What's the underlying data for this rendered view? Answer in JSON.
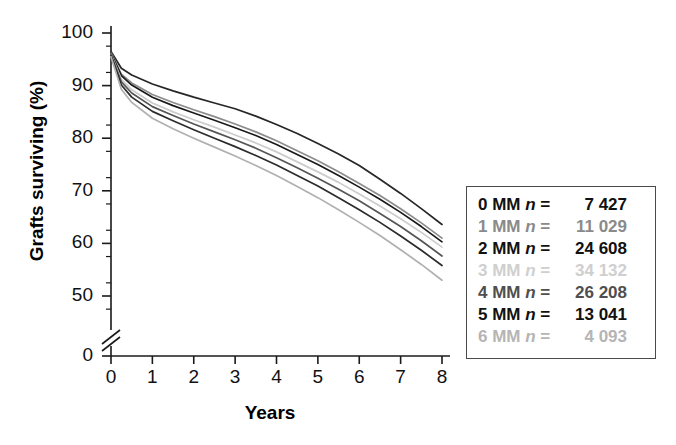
{
  "chart_data": {
    "type": "line",
    "title": "",
    "xlabel": "Years",
    "ylabel": "Grafts surviving (%)",
    "xlim": [
      0,
      8
    ],
    "ylim": [
      45,
      100
    ],
    "y_axis_break": true,
    "y_break_value": 0,
    "grid": false,
    "legend_position": "right-outside",
    "xticks": [
      "0",
      "1",
      "2",
      "3",
      "4",
      "5",
      "6",
      "7",
      "8"
    ],
    "yticks": [
      "0",
      "50",
      "60",
      "70",
      "80",
      "90",
      "100"
    ],
    "y_minor_tick_interval": 5,
    "x": [
      0,
      0.25,
      0.5,
      1,
      1.5,
      2,
      2.5,
      3,
      3.5,
      4,
      4.5,
      5,
      5.5,
      6,
      6.5,
      7,
      7.5,
      8
    ],
    "series": [
      {
        "name": "0 MM",
        "n": "7 427",
        "color": "#262626",
        "values": [
          96.5,
          93.3,
          92.0,
          90.3,
          89.0,
          87.8,
          86.7,
          85.6,
          84.2,
          82.6,
          80.9,
          79.0,
          77.0,
          74.8,
          72.2,
          69.5,
          66.6,
          63.6
        ]
      },
      {
        "name": "1 MM",
        "n": "11 029",
        "color": "#8c8c8c",
        "values": [
          96.3,
          92.2,
          90.5,
          88.3,
          86.8,
          85.4,
          84.1,
          82.7,
          81.2,
          79.5,
          77.6,
          75.7,
          73.6,
          71.4,
          69.1,
          66.6,
          63.9,
          61.0
        ]
      },
      {
        "name": "2 MM",
        "n": "24 608",
        "color": "#1a1a1a",
        "values": [
          96.2,
          91.9,
          90.1,
          87.8,
          86.2,
          84.8,
          83.4,
          82.0,
          80.5,
          78.8,
          76.9,
          75.0,
          72.9,
          70.7,
          68.4,
          65.9,
          63.2,
          60.3
        ]
      },
      {
        "name": "3 MM",
        "n": "34 132",
        "color": "#cccccc",
        "values": [
          96.0,
          91.2,
          89.2,
          86.7,
          85.0,
          83.5,
          82.1,
          80.6,
          79.1,
          77.4,
          75.5,
          73.6,
          71.6,
          69.4,
          67.1,
          64.7,
          62.1,
          59.3
        ]
      },
      {
        "name": "4 MM",
        "n": "26 208",
        "color": "#555555",
        "values": [
          95.9,
          90.7,
          88.6,
          86.0,
          84.3,
          82.7,
          81.2,
          79.7,
          78.1,
          76.3,
          74.4,
          72.4,
          70.3,
          68.1,
          65.7,
          63.2,
          60.5,
          57.6
        ]
      },
      {
        "name": "5 MM",
        "n": "13 041",
        "color": "#2b2b2b",
        "values": [
          95.7,
          90.1,
          87.8,
          85.1,
          83.3,
          81.6,
          80.0,
          78.4,
          76.7,
          74.9,
          72.9,
          70.9,
          68.7,
          66.4,
          64.0,
          61.4,
          58.7,
          55.8
        ]
      },
      {
        "name": "6 MM",
        "n": "4 093",
        "color": "#b0b0b0",
        "values": [
          95.5,
          89.3,
          86.8,
          83.8,
          81.8,
          80.0,
          78.3,
          76.6,
          74.8,
          72.9,
          70.8,
          68.7,
          66.4,
          64.0,
          61.5,
          58.8,
          56.0,
          53.0
        ]
      }
    ]
  },
  "axes": {
    "ylabel": "Grafts surviving (%)",
    "xlabel": "Years",
    "ytick_labels": [
      "100",
      "90",
      "80",
      "70",
      "60",
      "50",
      "0"
    ],
    "xtick_labels": [
      "0",
      "1",
      "2",
      "3",
      "4",
      "5",
      "6",
      "7",
      "8"
    ]
  },
  "legend": {
    "equals": "=",
    "n_symbol": "n",
    "rows": [
      {
        "key": "0 MM",
        "n": "7 427",
        "color": "#111111"
      },
      {
        "key": "1 MM",
        "n": "11 029",
        "color": "#8a8a8a"
      },
      {
        "key": "2 MM",
        "n": "24 608",
        "color": "#111111"
      },
      {
        "key": "3 MM",
        "n": "34 132",
        "color": "#cfcfcf"
      },
      {
        "key": "4 MM",
        "n": "26 208",
        "color": "#4f4f4f"
      },
      {
        "key": "5 MM",
        "n": "13 041",
        "color": "#111111"
      },
      {
        "key": "6 MM",
        "n": "4 093",
        "color": "#b5b5b5"
      }
    ]
  }
}
